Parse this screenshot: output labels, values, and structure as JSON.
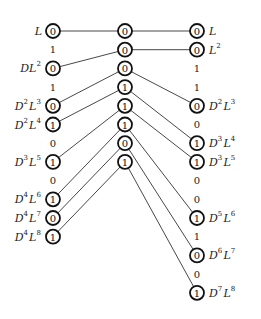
{
  "diagram": {
    "left_column": [
      {
        "type": "node",
        "value": "0",
        "label": {
          "parts": [
            [
              "L",
              ""
            ]
          ]
        }
      },
      {
        "type": "gap",
        "value": "1"
      },
      {
        "type": "node",
        "value": "0",
        "label": {
          "parts": [
            [
              "DL",
              "2"
            ]
          ]
        }
      },
      {
        "type": "gap",
        "value": "1"
      },
      {
        "type": "node",
        "value": "0",
        "label": {
          "parts": [
            [
              "D",
              "2"
            ],
            [
              "L",
              "3"
            ]
          ]
        }
      },
      {
        "type": "node",
        "value": "1",
        "label": {
          "parts": [
            [
              "D",
              "2"
            ],
            [
              "L",
              "4"
            ]
          ]
        }
      },
      {
        "type": "gap",
        "value": "0"
      },
      {
        "type": "node",
        "value": "1",
        "label": {
          "parts": [
            [
              "D",
              "3"
            ],
            [
              "L",
              "5"
            ]
          ]
        }
      },
      {
        "type": "gap",
        "value": "0"
      },
      {
        "type": "node",
        "value": "1",
        "label": {
          "parts": [
            [
              "D",
              "4"
            ],
            [
              "L",
              "6"
            ]
          ]
        }
      },
      {
        "type": "node",
        "value": "0",
        "label": {
          "parts": [
            [
              "D",
              "4"
            ],
            [
              "L",
              "7"
            ]
          ]
        }
      },
      {
        "type": "node",
        "value": "1",
        "label": {
          "parts": [
            [
              "D",
              "4"
            ],
            [
              "L",
              "8"
            ]
          ]
        }
      }
    ],
    "middle_column": [
      "0",
      "0",
      "0",
      "1",
      "1",
      "1",
      "0",
      "1"
    ],
    "right_column": [
      {
        "type": "node",
        "value": "0",
        "label": {
          "parts": [
            [
              "L",
              ""
            ]
          ]
        }
      },
      {
        "type": "node",
        "value": "0",
        "label": {
          "parts": [
            [
              "L",
              "2"
            ]
          ]
        }
      },
      {
        "type": "gap",
        "value": "1"
      },
      {
        "type": "gap",
        "value": "1"
      },
      {
        "type": "node",
        "value": "0",
        "label": {
          "parts": [
            [
              "D",
              "2"
            ],
            [
              "L",
              "3"
            ]
          ]
        }
      },
      {
        "type": "gap",
        "value": "0"
      },
      {
        "type": "node",
        "value": "1",
        "label": {
          "parts": [
            [
              "D",
              "3"
            ],
            [
              "L",
              "4"
            ]
          ]
        }
      },
      {
        "type": "node",
        "value": "1",
        "label": {
          "parts": [
            [
              "D",
              "3"
            ],
            [
              "L",
              "5"
            ]
          ]
        }
      },
      {
        "type": "gap",
        "value": "0"
      },
      {
        "type": "gap",
        "value": "0"
      },
      {
        "type": "node",
        "value": "1",
        "label": {
          "parts": [
            [
              "D",
              "5"
            ],
            [
              "L",
              "6"
            ]
          ]
        }
      },
      {
        "type": "gap",
        "value": "1"
      },
      {
        "type": "node",
        "value": "0",
        "label": {
          "parts": [
            [
              "D",
              "6"
            ],
            [
              "L",
              "7"
            ]
          ]
        }
      },
      {
        "type": "gap",
        "value": "0"
      },
      {
        "type": "node",
        "value": "1",
        "label": {
          "parts": [
            [
              "D",
              "7"
            ],
            [
              "L",
              "8"
            ]
          ]
        }
      }
    ],
    "edges_left_to_middle": [
      [
        0,
        0
      ],
      [
        2,
        1
      ],
      [
        4,
        2
      ],
      [
        5,
        3
      ],
      [
        7,
        4
      ],
      [
        9,
        5
      ],
      [
        10,
        6
      ],
      [
        11,
        7
      ]
    ],
    "edges_middle_to_right": [
      [
        0,
        0
      ],
      [
        1,
        1
      ],
      [
        2,
        4
      ],
      [
        3,
        6
      ],
      [
        4,
        7
      ],
      [
        5,
        10
      ],
      [
        6,
        12
      ],
      [
        7,
        14
      ]
    ]
  }
}
